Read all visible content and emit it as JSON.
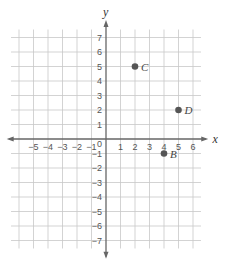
{
  "chart_data": {
    "type": "scatter",
    "title": "",
    "xlabel": "x",
    "ylabel": "y",
    "xlim": [
      -5,
      6
    ],
    "ylim": [
      -7,
      7
    ],
    "grid": true,
    "x_ticks": [
      "-5",
      "-4",
      "-3",
      "-2",
      "-1",
      "1",
      "2",
      "3",
      "4",
      "5",
      "6"
    ],
    "y_ticks": [
      "7",
      "6",
      "5",
      "4",
      "3",
      "2",
      "1",
      "-1",
      "-2",
      "-3",
      "-4",
      "-5",
      "-6",
      "-7"
    ],
    "origin_label": "0",
    "points": [
      {
        "label": "C",
        "x": 2,
        "y": 5
      },
      {
        "label": "D",
        "x": 5,
        "y": 2
      },
      {
        "label": "B",
        "x": 4,
        "y": -1
      }
    ]
  },
  "colors": {
    "grid": "#c8c8c8",
    "axis": "#666666",
    "point": "#555555"
  }
}
